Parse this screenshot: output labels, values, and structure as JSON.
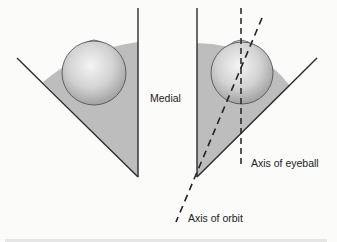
{
  "figure": {
    "labels": {
      "medial": "Medial",
      "axis_of_eyeball": "Axis of eyeball",
      "axis_of_orbit": "Axis of orbit"
    },
    "colors": {
      "background": "#fbfbfa",
      "orbit_fill": "#bdbdbd",
      "wall_line": "#2b2b2b",
      "eyeball_light": "#f2f2f2",
      "eyeball_dark": "#9a9a9a",
      "text": "#222222"
    },
    "panels": [
      {
        "name": "left-orbit",
        "description": "Eyeball in orbit, no axes"
      },
      {
        "name": "right-orbit",
        "description": "Eyeball in orbit with axis of eyeball and axis of orbit"
      }
    ]
  }
}
